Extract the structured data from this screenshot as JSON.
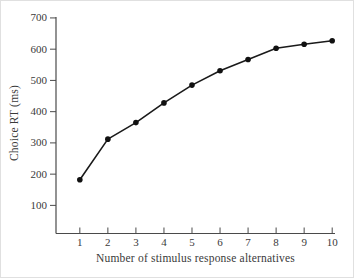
{
  "chart_data": {
    "type": "line",
    "title": "",
    "xlabel": "Number of stimulus response alternatives",
    "ylabel": "Choice RT (ms)",
    "x": [
      1,
      2,
      3,
      4,
      5,
      6,
      7,
      8,
      9,
      10
    ],
    "series": [
      {
        "name": "Choice RT",
        "values": [
          182,
          312,
          365,
          428,
          485,
          531,
          567,
          603,
          616,
          627
        ]
      }
    ],
    "xticks": [
      "1",
      "2",
      "3",
      "4",
      "5",
      "6",
      "7",
      "8",
      "9",
      "10"
    ],
    "yticks": [
      100,
      200,
      300,
      400,
      500,
      600,
      700
    ],
    "xlim": [
      0.15,
      10.1
    ],
    "ylim": [
      10,
      703
    ],
    "grid": false,
    "legend": "none",
    "line_color": "#1a1a1a",
    "marker": "filled-circle",
    "marker_color": "#111111",
    "text_color": "#3a3a3a",
    "axis_color": "#4a4a4a",
    "background": "#ffffff"
  }
}
